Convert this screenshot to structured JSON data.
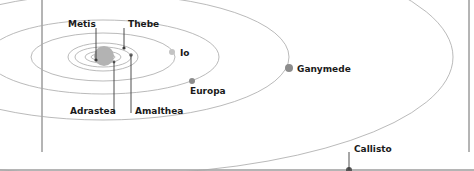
{
  "diagram": {
    "planet": {
      "name": "Jupiter",
      "color": "#b3b3b3"
    },
    "moons": [
      {
        "name": "Metis",
        "label": "Metis"
      },
      {
        "name": "Thebe",
        "label": "Thebe"
      },
      {
        "name": "Io",
        "label": "Io"
      },
      {
        "name": "Europa",
        "label": "Europa"
      },
      {
        "name": "Ganymede",
        "label": "Ganymede"
      },
      {
        "name": "Adrastea",
        "label": "Adrastea"
      },
      {
        "name": "Amalthea",
        "label": "Amalthea"
      },
      {
        "name": "Callisto",
        "label": "Callisto"
      }
    ],
    "colors": {
      "orbit": "#a8a8a8",
      "moon": "#8c8c8c",
      "io": "#c4c4c4",
      "leader": "#3a3a3a",
      "frame": "#6a6a6a"
    }
  }
}
